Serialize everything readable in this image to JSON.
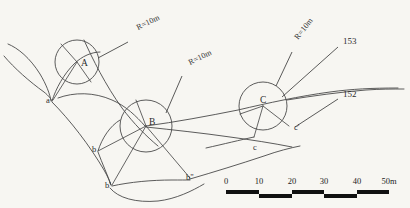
{
  "diagram": {
    "background_color": "#f7f6f2",
    "line_color": "#4a4a4a",
    "curves": [
      {
        "name": "circle-A",
        "center_label": "A",
        "center_x": 77,
        "center_y": 62,
        "radius_px": 22,
        "radius_note": "R=10m"
      },
      {
        "name": "circle-B",
        "center_label": "B",
        "center_x": 146,
        "center_y": 126,
        "radius_px": 26,
        "radius_note": "R=10m"
      },
      {
        "name": "circle-C",
        "center_label": "C",
        "center_x": 263,
        "center_y": 106,
        "radius_px": 24,
        "radius_note": "R=10m"
      }
    ],
    "point_labels": [
      {
        "id": "a",
        "text": "a",
        "x": 46,
        "y": 103
      },
      {
        "id": "b",
        "text": "b",
        "x": 92,
        "y": 152
      },
      {
        "id": "bp",
        "text": "b'",
        "x": 105,
        "y": 188
      },
      {
        "id": "bpp",
        "text": "b\"",
        "x": 186,
        "y": 180
      },
      {
        "id": "c",
        "text": "c",
        "x": 253,
        "y": 150
      },
      {
        "id": "cp",
        "text": "c'",
        "x": 294,
        "y": 130
      }
    ],
    "radius_annotations": [
      {
        "id": "r1",
        "text": "R=10m",
        "label_x": 138,
        "label_y": 30,
        "angle": -26,
        "leader_from_x": 128,
        "leader_from_y": 42,
        "leader_to_x": 98,
        "leader_to_y": 58
      },
      {
        "id": "r2",
        "text": "R=10m",
        "label_x": 190,
        "label_y": 65,
        "angle": -26,
        "leader_from_x": 182,
        "leader_from_y": 76,
        "leader_to_x": 166,
        "leader_to_y": 113
      },
      {
        "id": "r3",
        "text": "R=10m",
        "label_x": 298,
        "label_y": 40,
        "angle": -52,
        "leader_from_x": 292,
        "leader_from_y": 52,
        "leader_to_x": 276,
        "leader_to_y": 86
      }
    ],
    "station_labels": [
      {
        "id": "153",
        "text": "153",
        "x": 343,
        "y": 44,
        "leader_from_x": 338,
        "leader_from_y": 47,
        "leader_to_x": 282,
        "leader_to_y": 97
      },
      {
        "id": "152",
        "text": "152",
        "x": 343,
        "y": 97,
        "leader_from_x": 338,
        "leader_from_y": 99,
        "leader_to_x": 295,
        "leader_to_y": 127
      }
    ]
  },
  "scale_bar": {
    "name": "scale-bar",
    "unit_suffix": "m",
    "ticks": [
      "0",
      "10",
      "20",
      "30",
      "40",
      "50m"
    ],
    "tick_values": [
      0,
      10,
      20,
      30,
      40,
      50
    ],
    "start_x": 226,
    "end_x": 389,
    "baseline_y": 190,
    "bar_thickness": 4,
    "label_y": 180
  }
}
